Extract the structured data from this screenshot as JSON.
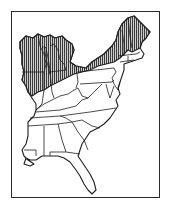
{
  "map": {
    "title": "",
    "subject": "Range map — eastern United States",
    "region": "Eastern United States",
    "legend": [
      {
        "label": "Range (hatched)",
        "pattern": "vertical-hatch"
      }
    ],
    "colors": {
      "ink": "#1e1e1e",
      "background": "#ffffff",
      "hatch": "#3a3a3a"
    },
    "range_states": [
      "Wisconsin",
      "Michigan",
      "Illinois (north)",
      "Indiana (north)",
      "Ohio (north)",
      "Pennsylvania (north)",
      "New York",
      "Vermont",
      "New Hampshire",
      "Maine"
    ],
    "states": [
      "Wisconsin",
      "Michigan",
      "Illinois",
      "Indiana",
      "Ohio",
      "Kentucky",
      "Tennessee",
      "Mississippi",
      "Alabama",
      "Georgia",
      "Florida",
      "South Carolina",
      "North Carolina",
      "Virginia",
      "West Virginia",
      "Maryland",
      "Delaware",
      "New Jersey",
      "Pennsylvania",
      "New York",
      "Connecticut",
      "Rhode Island",
      "Massachusetts",
      "Vermont",
      "New Hampshire",
      "Maine",
      "Louisiana (part)"
    ]
  }
}
